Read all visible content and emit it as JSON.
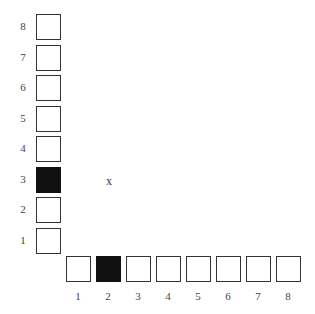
{
  "vertical_axis": {
    "labels": [
      "8",
      "7",
      "6",
      "5",
      "4",
      "3",
      "2",
      "1"
    ],
    "filled_index": 3
  },
  "horizontal_axis": {
    "labels": [
      "1",
      "2",
      "3",
      "4",
      "5",
      "6",
      "7",
      "8"
    ],
    "filled_index": 2
  },
  "marker": {
    "text": "x"
  },
  "colors": {
    "filled": "#111111",
    "border": "#333333"
  }
}
